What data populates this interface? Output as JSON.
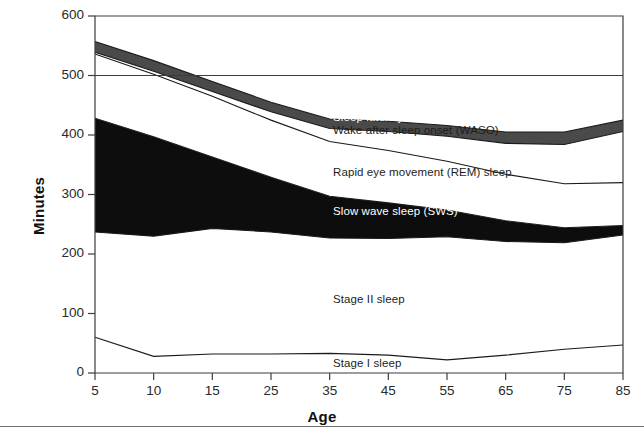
{
  "figure": {
    "y_axis_title": "Minutes",
    "x_axis_title": "Age"
  },
  "axes": {
    "y_ticks": [
      "0",
      "100",
      "200",
      "300",
      "400",
      "500",
      "600"
    ],
    "x_ticks": [
      "5",
      "10",
      "15",
      "25",
      "35",
      "45",
      "55",
      "65",
      "75",
      "85"
    ]
  },
  "series_labels": {
    "sleep_latency": "Sleep latency",
    "waso": "Wake after sleep onset (WASO)",
    "rem": "Rapid eye movement (REM) sleep",
    "sws": "Slow wave sleep (SWS)",
    "stage2": "Stage II sleep",
    "stage1": "Stage I sleep"
  },
  "colors": {
    "sleep_latency": "#4a4a4a",
    "sws": "#0d0d0d",
    "stage2": "#ffffff",
    "rem": "#ffffff",
    "waso": "#ffffff",
    "stage1": "#ffffff",
    "line": "#1a1a1a",
    "axis": "#3c3c3c"
  },
  "chart_data": {
    "type": "area",
    "title": "",
    "subtitle": "",
    "xlabel": "Age",
    "ylabel": "Minutes",
    "categories": [
      "5",
      "10",
      "15",
      "25",
      "35",
      "45",
      "55",
      "65",
      "75",
      "85"
    ],
    "x": [
      5,
      10,
      15,
      25,
      35,
      45,
      55,
      65,
      75,
      85
    ],
    "xlim": [
      5,
      85
    ],
    "ylim": [
      0,
      600
    ],
    "yticks": [
      0,
      100,
      200,
      300,
      400,
      500,
      600
    ],
    "grid": false,
    "legend": "inline-labels",
    "stacked": true,
    "stack_order_bottom_to_top": [
      "Stage I sleep",
      "Stage II sleep",
      "Slow wave sleep (SWS)",
      "Rapid eye movement (REM) sleep",
      "Wake after sleep onset (WASO)",
      "Sleep latency"
    ],
    "series": [
      {
        "name": "Stage I sleep",
        "values": [
          60,
          28,
          32,
          32,
          33,
          30,
          22,
          30,
          40,
          47
        ]
      },
      {
        "name": "Stage II sleep",
        "values": [
          177,
          202,
          211,
          205,
          194,
          196,
          207,
          191,
          179,
          185
        ]
      },
      {
        "name": "Slow wave sleep (SWS)",
        "values": [
          191,
          167,
          120,
          92,
          70,
          60,
          45,
          35,
          25,
          16
        ]
      },
      {
        "name": "Rapid eye movement (REM) sleep",
        "values": [
          108,
          105,
          102,
          96,
          92,
          88,
          82,
          78,
          74,
          72
        ]
      },
      {
        "name": "Wake after sleep onset (WASO)",
        "values": [
          3,
          5,
          8,
          14,
          22,
          32,
          42,
          52,
          66,
          86
        ]
      },
      {
        "name": "Sleep latency",
        "values": [
          18,
          18,
          17,
          16,
          16,
          17,
          18,
          19,
          21,
          19
        ]
      }
    ],
    "cumulative_boundaries": [
      {
        "name": "Stage I top",
        "values": [
          60,
          28,
          32,
          32,
          33,
          30,
          22,
          30,
          40,
          47
        ]
      },
      {
        "name": "Stage II top",
        "values": [
          237,
          230,
          243,
          237,
          227,
          226,
          229,
          221,
          219,
          232
        ]
      },
      {
        "name": "SWS top",
        "values": [
          428,
          397,
          363,
          329,
          297,
          286,
          274,
          256,
          244,
          248
        ]
      },
      {
        "name": "REM top",
        "values": [
          536,
          502,
          465,
          425,
          389,
          374,
          356,
          334,
          318,
          320
        ]
      },
      {
        "name": "WASO top",
        "values": [
          539,
          507,
          473,
          439,
          411,
          406,
          398,
          386,
          384,
          406
        ]
      },
      {
        "name": "Total sleep period top",
        "values": [
          557,
          525,
          490,
          455,
          427,
          423,
          416,
          405,
          405,
          425
        ]
      }
    ],
    "annotations": [
      {
        "text": "Sleep latency",
        "x": 45,
        "y": 420
      },
      {
        "text": "Wake after sleep onset (WASO)",
        "x": 45,
        "y": 398
      },
      {
        "text": "Rapid eye movement (REM) sleep",
        "x": 45,
        "y": 330
      },
      {
        "text": "Slow wave sleep (SWS)",
        "x": 45,
        "y": 268
      },
      {
        "text": "Stage II sleep",
        "x": 40,
        "y": 122
      },
      {
        "text": "Stage I sleep",
        "x": 45,
        "y": 22
      }
    ]
  }
}
